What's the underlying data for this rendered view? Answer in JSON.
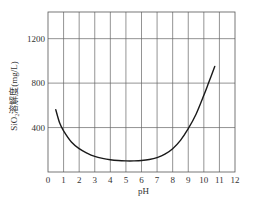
{
  "chart_data": {
    "type": "line",
    "title": "",
    "xlabel": "pH",
    "ylabel": "SiO₂溶解度(mg/L)",
    "xlim": [
      0,
      12
    ],
    "ylim": [
      0,
      1440
    ],
    "grid": true,
    "legend": "none",
    "x_ticks": [
      0,
      1,
      2,
      3,
      4,
      5,
      6,
      7,
      8,
      9,
      10,
      11,
      12
    ],
    "x_tick_labels": [
      "0",
      "1",
      "2",
      "3",
      "4",
      "5",
      "6",
      "7",
      "8",
      "9",
      "10",
      "11",
      "12"
    ],
    "y_ticks": [
      400,
      800,
      1200
    ],
    "y_tick_labels": [
      "400",
      "800",
      "1200"
    ],
    "series": [
      {
        "name": "SiO2 solubility",
        "color": "#1a1a1a",
        "x": [
          0.5,
          0.75,
          1,
          1.5,
          2,
          2.5,
          3,
          3.5,
          4,
          4.5,
          5,
          5.5,
          6,
          6.5,
          7,
          7.5,
          8,
          8.5,
          9,
          9.5,
          10,
          10.3,
          10.7
        ],
        "y": [
          560,
          440,
          370,
          270,
          210,
          170,
          140,
          122,
          110,
          103,
          100,
          100,
          103,
          112,
          130,
          160,
          210,
          285,
          390,
          520,
          690,
          800,
          950
        ]
      }
    ]
  }
}
